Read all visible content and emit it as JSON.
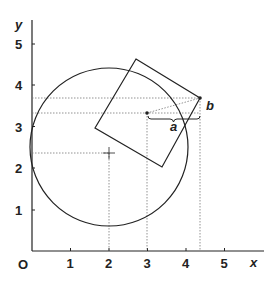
{
  "axes": {
    "x_label": "x",
    "y_label": "y",
    "origin_label": "O",
    "x_ticks": [
      "1",
      "2",
      "3",
      "4",
      "5"
    ],
    "y_ticks": [
      "1",
      "2",
      "3",
      "4",
      "5"
    ]
  },
  "circle": {
    "center": [
      2,
      2.5
    ],
    "radius": 2
  },
  "square": {
    "vertices": [
      [
        2.75,
        4.85
      ],
      [
        4.4,
        3.85
      ],
      [
        3.4,
        2.1
      ],
      [
        1.75,
        3.1
      ]
    ]
  },
  "points": {
    "p1": {
      "x": 3,
      "y": 3.45
    },
    "p2": {
      "x": 4.4,
      "y": 3.85
    }
  },
  "labels": {
    "a": "a",
    "b": "b"
  },
  "colors": {
    "line": "#222222",
    "dotted": "#777777"
  }
}
